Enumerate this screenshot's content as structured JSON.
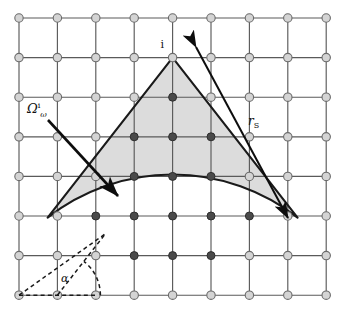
{
  "figure": {
    "type": "geometry-diagram",
    "background_color": "#ffffff",
    "sector_fill": "#dcdcdc",
    "sector_stroke": "#1a1a1a",
    "grid_line_color": "#5a5a5a",
    "node_fill_light": "#d4d4d4",
    "node_fill_dark": "#4a4a4a",
    "node_stroke": "#6b6b6b",
    "arrow_color": "#0d0d0d",
    "dash_color": "#1a1a1a"
  },
  "grid": {
    "cols": 9,
    "rows": 8,
    "x0": 19,
    "y0": 18,
    "dx": 38.4,
    "dy": 39.6
  },
  "sector": {
    "apex_col": 4,
    "apex_row": 1,
    "radius_px": 203,
    "half_angle_deg": 38,
    "axis_deg": 90
  },
  "highlighted_nodes": [
    {
      "col": 4,
      "row": 2
    },
    {
      "col": 3,
      "row": 3
    },
    {
      "col": 4,
      "row": 3
    },
    {
      "col": 5,
      "row": 3
    },
    {
      "col": 3,
      "row": 4
    },
    {
      "col": 4,
      "row": 4
    },
    {
      "col": 5,
      "row": 4
    },
    {
      "col": 2,
      "row": 5
    },
    {
      "col": 3,
      "row": 5
    },
    {
      "col": 4,
      "row": 5
    },
    {
      "col": 5,
      "row": 5
    },
    {
      "col": 6,
      "row": 5
    },
    {
      "col": 3,
      "row": 6
    },
    {
      "col": 4,
      "row": 6
    },
    {
      "col": 5,
      "row": 6
    }
  ],
  "labels": {
    "apex": "i",
    "radius_symbol": "r",
    "radius_subscript": "S",
    "omega_symbol": "Ω",
    "omega_subscript": "ω",
    "omega_superscript": "i",
    "angle_symbol": "α"
  },
  "annotations": {
    "radius_arrow": {
      "name": "double-headed arrow labelled r_S along the right sector radius",
      "from_x": 196,
      "from_y": 47,
      "to_x": 288,
      "to_y": 218
    },
    "omega_arrow": {
      "name": "arrow from label omega to the shaded sector interior",
      "from_x": 48,
      "from_y": 120,
      "to_x": 118,
      "to_y": 196
    },
    "angle_arc": {
      "name": "dashed angle alpha between bottom grid line and left sector radius"
    }
  }
}
